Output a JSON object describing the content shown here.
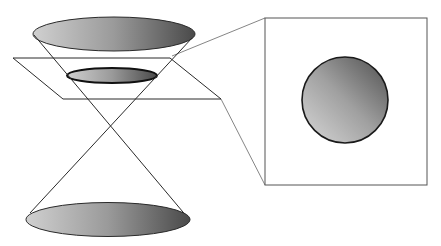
{
  "diagram": {
    "colors": {
      "background": "#ffffff",
      "stroke": "#2a2a2a",
      "thin_stroke": "#777777",
      "gradient_light": "#d4d4d4",
      "gradient_mid": "#9a9a9a",
      "gradient_dark": "#4a4a4a"
    },
    "top_ellipse": {
      "cx": 114,
      "cy": 34,
      "rx": 81,
      "ry": 17
    },
    "section_ellipse": {
      "cx": 112,
      "cy": 75.5,
      "rx": 45,
      "ry": 7.5
    },
    "bottom_ellipse": {
      "cx": 108,
      "cy": 219.5,
      "rx": 82,
      "ry": 17
    },
    "apex": {
      "x": 110,
      "y": 125
    },
    "generators": [
      {
        "x1": 34,
        "y1": 35,
        "x2": 188,
        "y2": 218
      },
      {
        "x1": 192,
        "y1": 38,
        "x2": 30,
        "y2": 213
      }
    ],
    "cutting_plane": {
      "points": "13,58 170,58 221,99 63,99"
    },
    "projection_lines": [
      {
        "x1": 172,
        "y1": 56,
        "x2": 265,
        "y2": 18
      },
      {
        "x1": 221,
        "y1": 99,
        "x2": 265,
        "y2": 185
      }
    ],
    "view_box": {
      "x": 265,
      "y": 18,
      "width": 162,
      "height": 167
    },
    "circle": {
      "cx": 345,
      "cy": 100,
      "r": 43
    }
  }
}
